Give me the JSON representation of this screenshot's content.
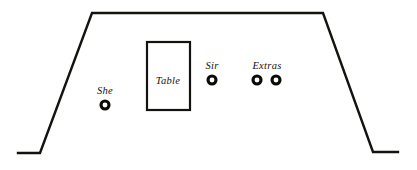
{
  "diagram": {
    "type": "stage-blocking-floor-plan",
    "background_color": "#ffffff",
    "ink_color": "#15130f",
    "width": 417,
    "height": 170,
    "room": {
      "name": "room-outline",
      "shape": "open-bottom trapezoid with flared base stubs",
      "points": "18,153 40,153 92,13 323,13 373,152 398,152"
    },
    "furniture": [
      {
        "name": "table",
        "label": "Table",
        "x": 147,
        "y": 42,
        "width": 43,
        "height": 68,
        "label_x": 168,
        "label_y": 80
      }
    ],
    "markers": [
      {
        "name": "she",
        "label": "She",
        "cx": 105,
        "cy": 105,
        "r": 4,
        "label_x": 105,
        "label_y": 94
      },
      {
        "name": "sir",
        "label": "Sir",
        "cx": 212,
        "cy": 80,
        "r": 4,
        "label_x": 212,
        "label_y": 69
      },
      {
        "name": "extras-1",
        "label": "Extras",
        "cx": 257,
        "cy": 80,
        "r": 4,
        "label_x": 267,
        "label_y": 69
      },
      {
        "name": "extras-2",
        "label": "",
        "cx": 276,
        "cy": 80,
        "r": 4,
        "label_x": 0,
        "label_y": 0
      }
    ]
  }
}
